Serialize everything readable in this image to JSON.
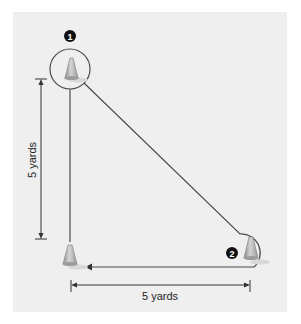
{
  "diagram": {
    "type": "drill-setup",
    "markers": [
      {
        "id": 1,
        "label": "1",
        "cone": "top-left"
      },
      {
        "id": 2,
        "label": "2",
        "cone": "bottom-right"
      }
    ],
    "cones": [
      "top-left",
      "bottom-left",
      "bottom-right"
    ],
    "dimensions": {
      "vertical": "5 yards",
      "horizontal": "5 yards"
    },
    "colors": {
      "background": "#efefef",
      "path": "#4a4a4a",
      "cone": "#b8b8b8",
      "marker": "#111111"
    }
  }
}
